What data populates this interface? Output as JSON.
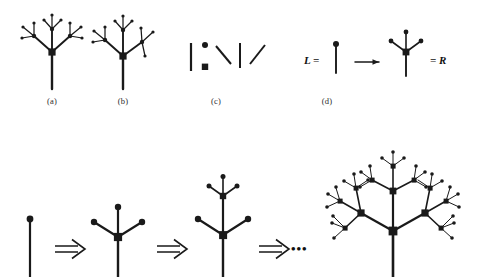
{
  "figure": {
    "type": "l-system-tree-rewriting-diagram",
    "background_color": "#ffffff",
    "ink_color": "#1a1a1a",
    "width": 484,
    "height": 277
  },
  "panel_labels": [
    {
      "id": "a",
      "text": "(a)",
      "x": 52,
      "y": 101
    },
    {
      "id": "b",
      "text": "(b)",
      "x": 123,
      "y": 101
    },
    {
      "id": "c",
      "text": "(c)",
      "x": 216,
      "y": 101
    },
    {
      "id": "d",
      "text": "(d)",
      "x": 327,
      "y": 101
    }
  ],
  "math_labels": {
    "left_side": "L =",
    "right_side": "= R"
  },
  "continuation": {
    "ellipsis": "•••"
  },
  "top_row": {
    "panel_a": {
      "caption": "(a)",
      "description": "symmetric branching tree, 3 generations, square junction node, round leaf nodes"
    },
    "panel_b": {
      "caption": "(b)",
      "description": "asymmetric branching tree variant with extended right sub-branch"
    },
    "panel_c": {
      "caption": "(c)",
      "description": "alphabet of primitives: vertical segment, round node, square node, and three oriented segments"
    },
    "panel_d": {
      "caption": "(d)",
      "description": "production rule L arrow R: single stem with round tip rewrites into square node with three branched round tips"
    }
  },
  "bottom_row": {
    "description": "iterative derivation sequence of the L-system",
    "stages": [
      {
        "index": 0,
        "name": "axiom",
        "label": ""
      },
      {
        "index": 1,
        "name": "generation-1",
        "label": ""
      },
      {
        "index": 2,
        "name": "generation-2",
        "label": ""
      },
      {
        "index": 3,
        "name": "generation-3",
        "label": ""
      }
    ],
    "arrows": [
      {
        "index": 0,
        "glyph": "⇒"
      },
      {
        "index": 1,
        "glyph": "⇒"
      },
      {
        "index": 2,
        "glyph": "⇒"
      }
    ]
  },
  "colors": {
    "ink": "#1a1a1a",
    "background": "#ffffff",
    "label_gray": "#2b2b2b"
  }
}
